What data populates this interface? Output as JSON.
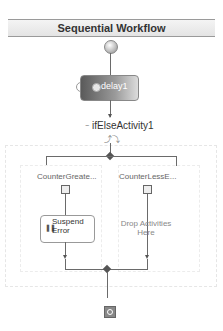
{
  "workflow": {
    "title": "Sequential Workflow",
    "activities": {
      "delay": {
        "label": "delay1"
      },
      "ifElse": {
        "label": "ifElseActivity1",
        "branches": [
          {
            "label": "CounterGreate...",
            "activity": "Suspend Error",
            "activity_line1": "Suspend",
            "activity_line2": "Error"
          },
          {
            "label": "CounterLessE...",
            "placeholder_line1": "Drop Activities",
            "placeholder_line2": "Here"
          }
        ]
      }
    }
  }
}
